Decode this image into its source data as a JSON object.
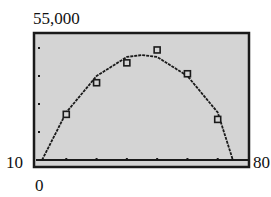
{
  "window_labels": {
    "ymax": "55,000",
    "ymin": "10",
    "xmin": "0",
    "xmax": "80"
  },
  "colors": {
    "screen_bg": "#d4d4d4",
    "frame": "#1a1a1a",
    "curve": "#1a1a1a",
    "marker": "#1a1a1a"
  },
  "chart_data": {
    "type": "scatter",
    "title": "",
    "xlabel": "",
    "ylabel": "",
    "xlim": [
      10,
      80
    ],
    "ylim": [
      10000,
      55000
    ],
    "x_tick_step": 10,
    "y_tick_step": 10000,
    "grid": false,
    "legend": null,
    "series": [
      {
        "name": "data points",
        "marker": "square",
        "x": [
          20,
          30,
          40,
          50,
          60,
          70
        ],
        "y": [
          26300,
          37600,
          44700,
          49300,
          40800,
          24500
        ]
      },
      {
        "name": "quadratic model",
        "style": "line",
        "x": [
          12,
          20,
          30,
          40,
          45,
          50,
          60,
          70,
          75
        ],
        "y": [
          10000,
          27000,
          40000,
          46800,
          47500,
          46800,
          40000,
          27000,
          10000
        ]
      }
    ],
    "annotations": [
      "55,000",
      "10",
      "0",
      "80"
    ]
  }
}
